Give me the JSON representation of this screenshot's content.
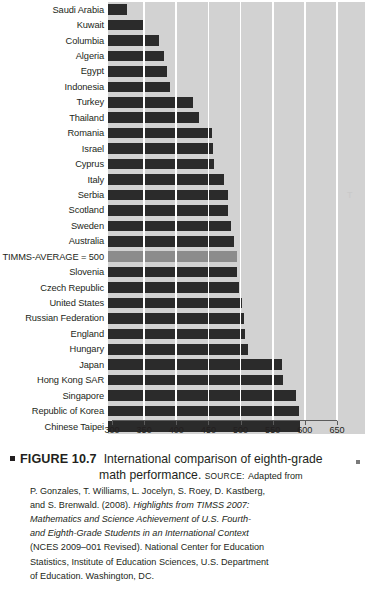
{
  "figure": {
    "number_label": "FIGURE 10.7",
    "title": "International comparison of eighth-grade math performance.",
    "source_label": "Source:",
    "source_lead": "Adapted from",
    "source_lines": [
      "P. Gonzales, T. Williams, L. Jocelyn, S. Roey, D. Kastberg,",
      "and S. Brenwald. (2008). ",
      "(NCES 2009–001 Revised). National Center for Education",
      "Statistics, Institute of Education Sciences, U.S. Department",
      "of Education. Washington, DC."
    ],
    "source_italic_title": "Highlights from TIMSS 2007: Mathematics and Science Achievement of U.S. Fourth- and Eighth-Grade Students in an International Context",
    "margin_glyph": "T"
  },
  "chart_data": {
    "type": "bar",
    "orientation": "horizontal",
    "title": "International comparison of eighth-grade math performance",
    "xlabel": "",
    "ylabel": "",
    "xlim": [
      300,
      650
    ],
    "xticks": [
      300,
      350,
      400,
      450,
      500,
      550,
      600,
      650
    ],
    "xticklabels": [
      "300",
      "350",
      "400",
      "450",
      "500",
      "550",
      "600",
      "650"
    ],
    "grid": true,
    "grid_axis": "x",
    "legend": false,
    "bar_color": "#2b2b2b",
    "highlight_color": "#8c8c8c",
    "plot_background": "#d2d2d2",
    "highlight_category": "TIMMS-AVERAGE = 500",
    "categories": [
      "Saudi Arabia",
      "Kuwait",
      "Columbia",
      "Algeria",
      "Egypt",
      "Indonesia",
      "Turkey",
      "Thailand",
      "Romania",
      "Israel",
      "Cyprus",
      "Italy",
      "Serbia",
      "Scotland",
      "Sweden",
      "Australia",
      "TIMMS-AVERAGE = 500",
      "Slovenia",
      "Czech Republic",
      "United States",
      "Russian Federation",
      "England",
      "Hungary",
      "Japan",
      "Hong Kong SAR",
      "Singapore",
      "Republic of Korea",
      "Chinese Taipei"
    ],
    "values": [
      329,
      354,
      380,
      387,
      391,
      397,
      432,
      441,
      461,
      463,
      465,
      480,
      486,
      487,
      491,
      496,
      500,
      501,
      504,
      508,
      512,
      513,
      517,
      570,
      572,
      593,
      597,
      598
    ]
  }
}
